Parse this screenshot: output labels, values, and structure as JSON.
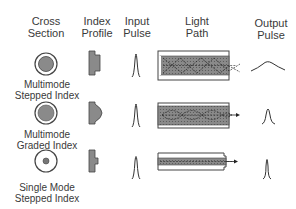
{
  "headers": {
    "cross_section": [
      "Cross",
      "Section"
    ],
    "index_profile": [
      "Index",
      "Profile"
    ],
    "input_pulse": [
      "Input",
      "Pulse"
    ],
    "light_path": [
      "Light",
      "Path"
    ],
    "output_pulse": [
      "Output",
      "Pulse"
    ]
  },
  "rows": [
    {
      "label": [
        "Multimode",
        "Stepped Index"
      ],
      "core": "large",
      "profile": "step",
      "path": "zigzag",
      "output": "broad"
    },
    {
      "label": [
        "Multimode",
        "Graded Index"
      ],
      "core": "large",
      "profile": "graded",
      "path": "sinusoidal",
      "output": "medium"
    },
    {
      "label": [
        "Single Mode",
        "Stepped Index"
      ],
      "core": "small",
      "profile": "narrow-step",
      "path": "straight",
      "output": "narrow"
    }
  ],
  "colors": {
    "core_fill": "#8a8a8a",
    "cladding": "#ffffff",
    "stroke": "#333333"
  }
}
